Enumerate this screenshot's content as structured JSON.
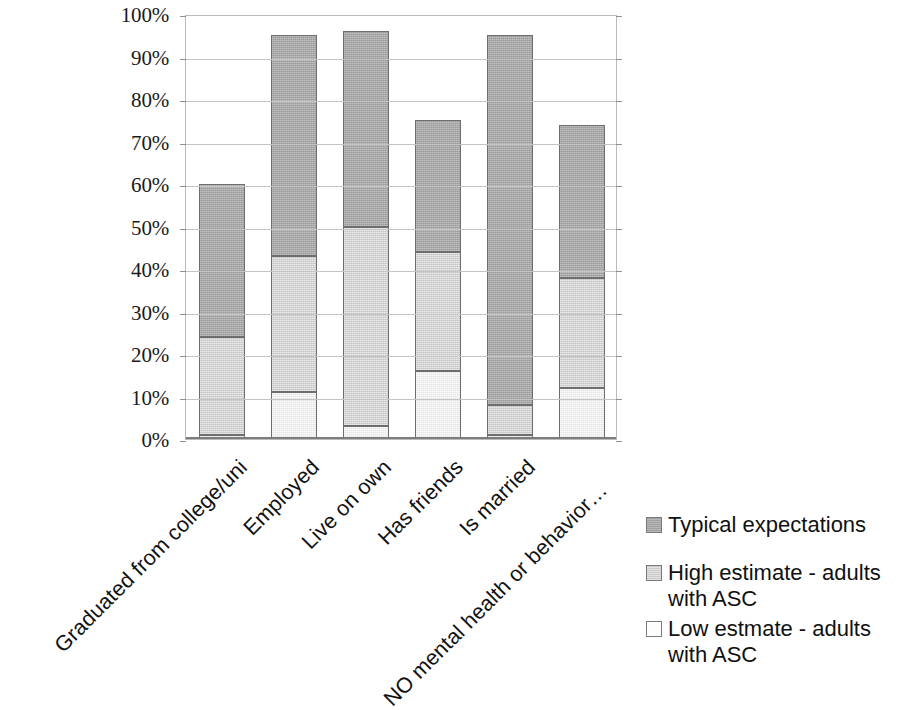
{
  "chart_data": {
    "type": "bar",
    "subtype": "stacked-bar",
    "title": "",
    "xlabel": "",
    "ylabel": "",
    "ylim": [
      0,
      100
    ],
    "grid": true,
    "legend_position": "right",
    "categories": [
      "Graduated from college/uni",
      "Employed",
      "Live on own",
      "Has friends",
      "Is married",
      "NO mental health or behavior…"
    ],
    "y_tick_labels": [
      "100%",
      "90%",
      "80%",
      "70%",
      "60%",
      "50%",
      "40%",
      "30%",
      "20%",
      "10%",
      "0%"
    ],
    "y_tick_values": [
      100,
      90,
      80,
      70,
      60,
      50,
      40,
      30,
      20,
      10,
      0
    ],
    "series": [
      {
        "name": "Typical expectations",
        "color": "#a9a9a9",
        "values": [
          60,
          95,
          96,
          75,
          95,
          74
        ]
      },
      {
        "name": "High estimate - adults with ASC",
        "color": "#d6d6d6",
        "values": [
          24,
          43,
          50,
          44,
          8,
          38
        ]
      },
      {
        "name": "Low estmate - adults with ASC",
        "color": "#f3f3f3",
        "values": [
          1,
          11,
          3,
          16,
          1,
          12
        ]
      }
    ],
    "stack_order_bottom_to_top": [
      "Low estmate - adults with ASC",
      "High estimate - adults with ASC",
      "Typical expectations"
    ]
  },
  "legend": {
    "entries": [
      {
        "label": "Typical expectations",
        "swatch": "dark-gray-swatch"
      },
      {
        "label": "High estimate - adults with ASC",
        "swatch": "light-gray-swatch"
      },
      {
        "label": "Low estmate - adults with ASC",
        "swatch": "white-swatch"
      }
    ]
  }
}
